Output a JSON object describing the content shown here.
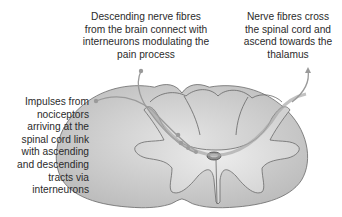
{
  "diagram": {
    "labels": {
      "descending": {
        "lines": [
          "Descending nerve fibres",
          "from the brain connect with",
          "interneurons modulating the",
          "pain process"
        ]
      },
      "ascending": {
        "lines": [
          "Nerve fibres cross",
          "the spinal cord and",
          "ascend towards the",
          "thalamus"
        ]
      },
      "impulses": {
        "lines": [
          "Impulses from",
          "nociceptors",
          "arriving at the",
          "spinal cord link",
          "with ascending",
          "and descending",
          "tracts via",
          "interneurons"
        ]
      }
    },
    "colors": {
      "white_matter": "#c9c9c9",
      "grey_matter": "#dcdcdc",
      "outline": "#6a6a6a",
      "pointer": "#9a9a9a",
      "text": "#2b2b2b"
    }
  }
}
